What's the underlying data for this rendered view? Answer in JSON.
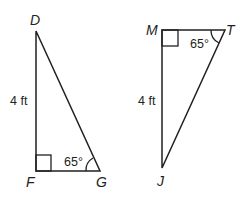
{
  "figure": {
    "triangles": [
      {
        "id": "DFG",
        "vertices": {
          "D": {
            "label": "D",
            "x": 36,
            "y": 31
          },
          "F": {
            "label": "F",
            "x": 36,
            "y": 171
          },
          "G": {
            "label": "G",
            "x": 100,
            "y": 171
          }
        },
        "right_angle_at": "F",
        "side_label": {
          "side": "DF",
          "text": "4 ft"
        },
        "angle_label": {
          "vertex": "G",
          "text": "65°"
        }
      },
      {
        "id": "MTJ",
        "vertices": {
          "M": {
            "label": "M",
            "x": 162,
            "y": 30
          },
          "T": {
            "label": "T",
            "x": 225,
            "y": 30
          },
          "J": {
            "label": "J",
            "x": 162,
            "y": 168
          }
        },
        "right_angle_at": "M",
        "side_label": {
          "side": "MJ",
          "text": "4 ft"
        },
        "angle_label": {
          "vertex": "T",
          "text": "65°"
        }
      }
    ],
    "colors": {
      "stroke": "#231f20",
      "background": "#ffffff"
    }
  }
}
